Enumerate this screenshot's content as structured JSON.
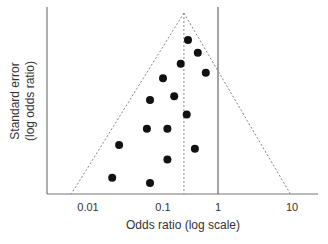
{
  "chart_data": {
    "type": "scatter",
    "subtype": "funnel-plot",
    "title": "",
    "xlabel": "Odds ratio (log scale)",
    "ylabel_lines": [
      "Standard error",
      "(log odds ratio)"
    ],
    "x_scale": "log",
    "x_ticks": [
      0.01,
      0.1,
      1,
      10
    ],
    "x_tick_labels": [
      "0.01",
      "0.1",
      "1",
      "10"
    ],
    "ylim": [
      0,
      1
    ],
    "y_inverted": true,
    "y_ticks": [],
    "grid": false,
    "legend": "none",
    "pooled_estimate": 0.24,
    "null_line": 1,
    "funnel_base": [
      0.006,
      9.5
    ],
    "points": [
      {
        "x": 0.285,
        "y": 0.15
      },
      {
        "x": 0.43,
        "y": 0.22
      },
      {
        "x": 0.21,
        "y": 0.28
      },
      {
        "x": 0.6,
        "y": 0.33
      },
      {
        "x": 0.1,
        "y": 0.36
      },
      {
        "x": 0.16,
        "y": 0.46
      },
      {
        "x": 0.067,
        "y": 0.48
      },
      {
        "x": 0.27,
        "y": 0.56
      },
      {
        "x": 0.061,
        "y": 0.64
      },
      {
        "x": 0.12,
        "y": 0.64
      },
      {
        "x": 0.026,
        "y": 0.73
      },
      {
        "x": 0.38,
        "y": 0.75
      },
      {
        "x": 0.12,
        "y": 0.81
      },
      {
        "x": 0.021,
        "y": 0.91
      },
      {
        "x": 0.067,
        "y": 0.94
      }
    ],
    "colors": {
      "points": "#111111",
      "axis": "#555555",
      "lines": "#777777",
      "text": "#333333"
    }
  }
}
